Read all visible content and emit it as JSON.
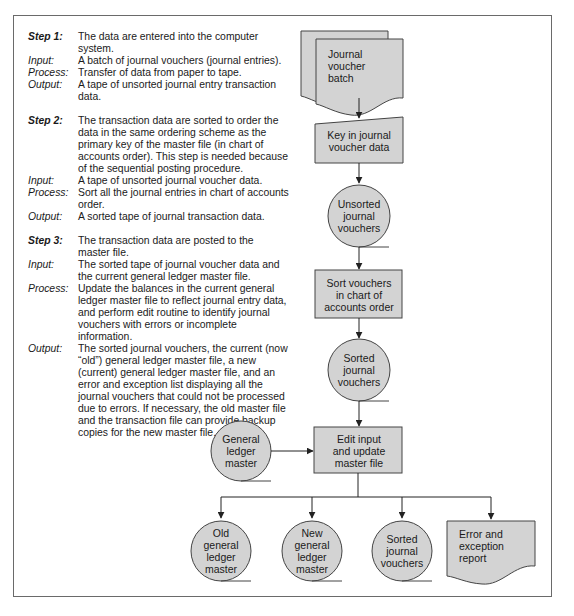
{
  "steps": [
    {
      "label": "Step 1:",
      "desc_lines": [
        "The data are entered into the computer",
        "system."
      ],
      "input_label": "Input:",
      "input_lines": [
        "A batch of journal vouchers (journal entries)."
      ],
      "process_label": "Process:",
      "process_lines": [
        "Transfer of data from paper to tape."
      ],
      "output_label": "Output:",
      "output_lines": [
        "A tape of unsorted journal entry transaction",
        "data."
      ]
    },
    {
      "label": "Step 2:",
      "desc_lines": [
        "The transaction data are sorted to order the",
        "data in the same ordering scheme as the",
        "primary key of the master file (in chart of",
        "accounts order). This step is needed because",
        "of the sequential posting procedure."
      ],
      "input_label": "Input:",
      "input_lines": [
        "A tape of unsorted journal voucher data."
      ],
      "process_label": "Process:",
      "process_lines": [
        "Sort all the journal entries in chart of accounts",
        "order."
      ],
      "output_label": "Output:",
      "output_lines": [
        "A sorted tape of journal transaction data."
      ]
    },
    {
      "label": "Step 3:",
      "desc_lines": [
        "The transaction data are posted to the",
        "master file."
      ],
      "input_label": "Input:",
      "input_lines": [
        "The sorted tape of journal voucher data and",
        "the current general ledger master file."
      ],
      "process_label": "Process:",
      "process_lines": [
        "Update the balances in the current general",
        "ledger master file to reflect journal entry data,",
        "and perform edit routine to identify journal",
        "vouchers with errors or incomplete information."
      ],
      "output_label": "Output:",
      "output_lines": [
        "The sorted journal vouchers, the current (now",
        "“old”) general ledger master file, a new",
        "(current) general ledger master file, and an",
        "error and exception list displaying all the",
        "journal vouchers that could not be processed",
        "due to errors. If necessary, the old master file",
        "and the transaction file can provide backup",
        "copies for the new master file."
      ]
    }
  ],
  "flowchart": {
    "colors": {
      "fill": "#d3d3d3",
      "stroke": "#444444",
      "frame": "#6a6a6a"
    },
    "nodes": {
      "journal_voucher_batch": {
        "type": "document-stack",
        "lines": [
          "Journal",
          "voucher",
          "batch"
        ]
      },
      "key_in": {
        "type": "manual-input",
        "lines": [
          "Key in journal",
          "voucher data"
        ]
      },
      "unsorted_tape": {
        "type": "magnetic-tape",
        "lines": [
          "Unsorted",
          "journal",
          "vouchers"
        ]
      },
      "sort": {
        "type": "process",
        "lines": [
          "Sort vouchers",
          "in chart of",
          "accounts order"
        ]
      },
      "sorted_tape": {
        "type": "magnetic-tape",
        "lines": [
          "Sorted",
          "journal",
          "vouchers"
        ]
      },
      "gl_master": {
        "type": "magnetic-tape",
        "lines": [
          "General",
          "ledger",
          "master"
        ]
      },
      "edit_update": {
        "type": "process",
        "lines": [
          "Edit input",
          "and update",
          "master file"
        ]
      },
      "old_gl": {
        "type": "magnetic-tape",
        "lines": [
          "Old",
          "general",
          "ledger",
          "master"
        ]
      },
      "new_gl": {
        "type": "magnetic-tape",
        "lines": [
          "New",
          "general",
          "ledger",
          "master"
        ]
      },
      "sorted_out": {
        "type": "magnetic-tape",
        "lines": [
          "Sorted",
          "journal",
          "vouchers"
        ]
      },
      "error_report": {
        "type": "document",
        "lines": [
          "Error and",
          "exception",
          "report"
        ]
      }
    }
  }
}
